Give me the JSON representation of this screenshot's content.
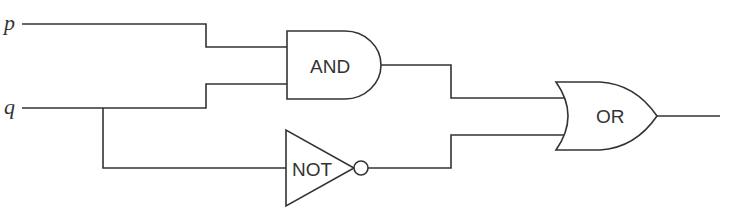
{
  "diagram": {
    "type": "logic-circuit",
    "inputs": [
      {
        "id": "p",
        "label": "p"
      },
      {
        "id": "q",
        "label": "q"
      }
    ],
    "gates": [
      {
        "id": "and",
        "type": "AND",
        "label": "AND",
        "inputs": [
          "p",
          "q"
        ]
      },
      {
        "id": "not",
        "type": "NOT",
        "label": "NOT",
        "inputs": [
          "q"
        ]
      },
      {
        "id": "or",
        "type": "OR",
        "label": "OR",
        "inputs": [
          "and",
          "not"
        ]
      }
    ],
    "output": "or",
    "expression": "(p AND q) OR (NOT q)",
    "colors": {
      "stroke": "#333333",
      "background": "#ffffff"
    }
  }
}
